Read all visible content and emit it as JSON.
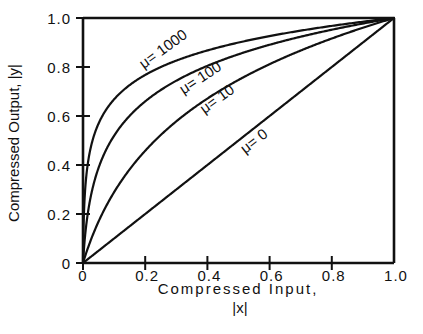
{
  "chart_data": {
    "type": "line",
    "title": "",
    "xlabel": "Compressed Input,",
    "xlabel_sub": "|x|",
    "ylabel": "Compressed Output,  |y|",
    "xlim": [
      0,
      1.0
    ],
    "ylim": [
      0,
      1.0
    ],
    "grid": false,
    "legend": "inline curve labels",
    "x_ticks": [
      "0",
      "0.2",
      "0.4",
      "0.6",
      "0.8",
      "1.0"
    ],
    "y_ticks": [
      "0",
      "0.2",
      "0.4",
      "0.6",
      "0.8",
      "1.0"
    ],
    "formula": "y = ln(1 + mu*x) / ln(1 + mu)",
    "x": [
      0,
      0.02,
      0.05,
      0.1,
      0.2,
      0.3,
      0.4,
      0.5,
      0.6,
      0.7,
      0.8,
      0.9,
      1.0
    ],
    "series": [
      {
        "name": "μ= 1000",
        "mu": 1000,
        "values": [
          0,
          0.44,
          0.57,
          0.67,
          0.77,
          0.83,
          0.87,
          0.9,
          0.93,
          0.95,
          0.97,
          0.98,
          1.0
        ]
      },
      {
        "name": "μ= 100",
        "mu": 100,
        "values": [
          0,
          0.24,
          0.39,
          0.52,
          0.66,
          0.75,
          0.8,
          0.85,
          0.89,
          0.92,
          0.95,
          0.98,
          1.0
        ]
      },
      {
        "name": "μ= 10",
        "mu": 10,
        "values": [
          0,
          0.08,
          0.17,
          0.29,
          0.46,
          0.58,
          0.67,
          0.75,
          0.82,
          0.88,
          0.94,
          0.97,
          1.0
        ]
      },
      {
        "name": "μ= 0",
        "mu": 0,
        "values": [
          0,
          0.02,
          0.05,
          0.1,
          0.2,
          0.3,
          0.4,
          0.5,
          0.6,
          0.7,
          0.8,
          0.9,
          1.0
        ]
      }
    ]
  },
  "labels": {
    "mu1000": "μ= 1000",
    "mu100": "μ= 100",
    "mu10": "μ= 10",
    "mu0": "μ= 0"
  }
}
